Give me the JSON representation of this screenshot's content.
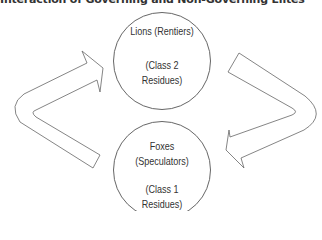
{
  "title": "Interaction of Governing and Non-Governing Elites",
  "nodes": [
    {
      "id": "lions",
      "name": "Lions (Rentiers)",
      "detail_line1": "(Class 2",
      "detail_line2": "Residues)"
    },
    {
      "id": "foxes",
      "name_line1": "Foxes",
      "name_line2": "(Speculators)",
      "detail_line1": "(Class 1",
      "detail_line2": "Residues)"
    }
  ],
  "edges": [
    {
      "from": "foxes",
      "to": "lions",
      "side": "left"
    },
    {
      "from": "lions",
      "to": "foxes",
      "side": "right"
    }
  ],
  "colors": {
    "stroke": "#555555",
    "text": "#333333",
    "background": "#ffffff"
  }
}
